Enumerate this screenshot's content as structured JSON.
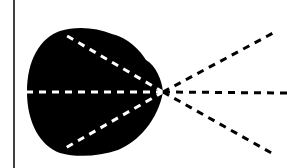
{
  "diagram": {
    "colors": {
      "background": "#ffffff",
      "ink": "#000000",
      "inner_dash": "#ffffff"
    },
    "wall_line": {
      "x": 14,
      "y1": 0,
      "y2": 168
    },
    "origin": {
      "x": 163,
      "y": 92
    },
    "lobe_path": "M 163 92 C 162 80, 156 66, 146 60 C 140 50, 128 38, 112 34 C 96 27, 75 26, 60 31 C 40 38, 27 60, 27 92 C 27 122, 40 146, 60 153 C 78 158, 100 156, 118 150 C 138 142, 158 120, 163 92 Z",
    "inner_rays": [
      {
        "name": "inner-ray-upper",
        "x2": 62,
        "y2": 33
      },
      {
        "name": "inner-ray-middle",
        "x2": 27,
        "y2": 92
      },
      {
        "name": "inner-ray-lower",
        "x2": 62,
        "y2": 150
      }
    ],
    "outer_rays": [
      {
        "name": "outer-ray-upper",
        "x2": 275,
        "y2": 32
      },
      {
        "name": "outer-ray-middle",
        "x2": 287,
        "y2": 93
      },
      {
        "name": "outer-ray-lower",
        "x2": 275,
        "y2": 155
      }
    ]
  }
}
